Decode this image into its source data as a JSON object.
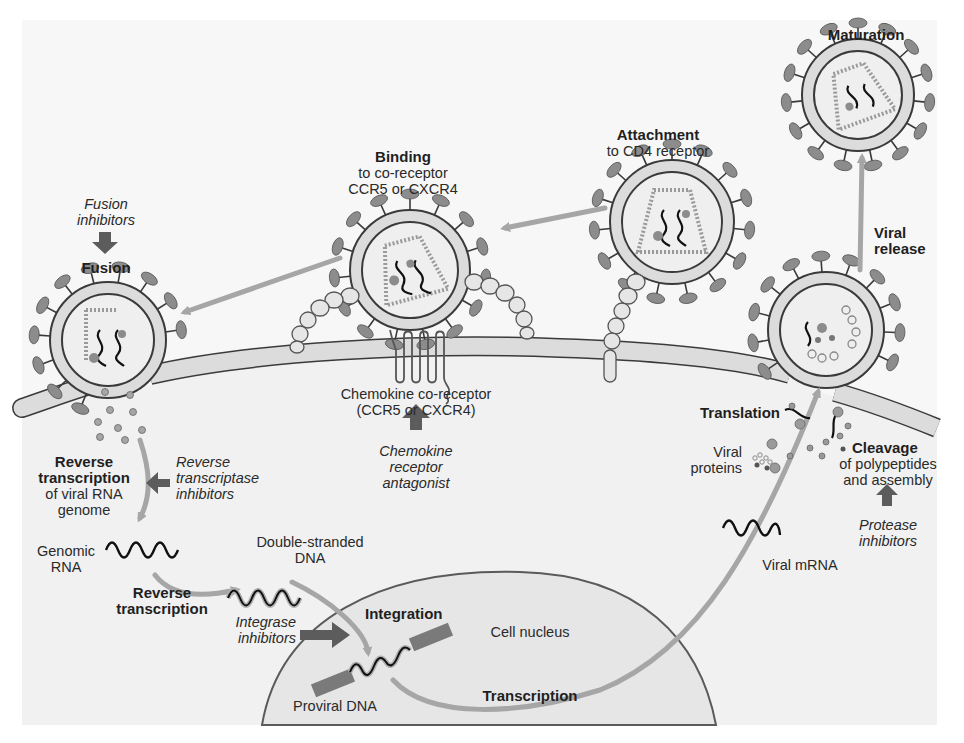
{
  "figure": {
    "colors": {
      "background": "#ffffff",
      "page_tint": "#f7f7f7",
      "cytoplasm": "#f1f1f1",
      "membrane_fill": "#dcdcdc",
      "membrane_stroke": "#3a3a3a",
      "spike": "#8c8c8c",
      "process_arrow": "#a6a6a6",
      "inhibitor_arrow": "#5c5c5c",
      "nucleus_fill": "#e6e6e6",
      "text": "#1f1f1f"
    }
  },
  "steps": {
    "attachment": {
      "title": "Attachment",
      "line1": "to CD4 receptor"
    },
    "binding": {
      "title": "Binding",
      "line1": "to co-receptor",
      "line2": "CCR5 or CXCR4"
    },
    "fusion": {
      "title": "Fusion"
    },
    "reverse_transcription_genome": {
      "title_line1": "Reverse",
      "title_line2": "transcription",
      "line1": "of viral RNA",
      "line2": "genome"
    },
    "reverse_transcription": {
      "title_line1": "Reverse",
      "title_line2": "transcription"
    },
    "integration": {
      "title": "Integration"
    },
    "transcription": {
      "title": "Transcription"
    },
    "translation": {
      "title": "Translation"
    },
    "cleavage": {
      "title": "Cleavage",
      "line1": "of polypeptides",
      "line2": "and assembly"
    },
    "viral_release": {
      "title_line1": "Viral",
      "title_line2": "release"
    },
    "maturation": {
      "title": "Maturation"
    }
  },
  "inhibitors": {
    "fusion": {
      "line1": "Fusion",
      "line2": "inhibitors"
    },
    "chemokine": {
      "line1": "Chemokine",
      "line2": "receptor",
      "line3": "antagonist"
    },
    "reverse_transcriptase": {
      "line1": "Reverse",
      "line2": "transcriptase",
      "line3": "inhibitors"
    },
    "integrase": {
      "line1": "Integrase",
      "line2": "inhibitors"
    },
    "protease": {
      "line1": "Protease",
      "line2": "inhibitors"
    }
  },
  "structures": {
    "coreceptor": {
      "line1": "Chemokine co-receptor",
      "line2": "(CCR5 or CXCR4)"
    },
    "genomic_rna": {
      "line1": "Genomic",
      "line2": "RNA"
    },
    "ds_dna": {
      "line1": "Double-stranded",
      "line2": "DNA"
    },
    "proviral_dna": {
      "label": "Proviral DNA"
    },
    "nucleus": {
      "label": "Cell nucleus"
    },
    "viral_mrna": {
      "label": "Viral mRNA"
    },
    "viral_proteins": {
      "line1": "Viral",
      "line2": "proteins"
    }
  }
}
